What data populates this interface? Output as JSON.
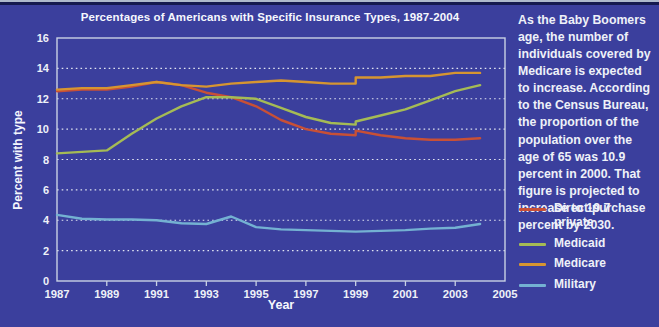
{
  "panel": {
    "background": "#3b3f9d",
    "title": "Percentages of Americans with Specific Insurance Types, 1987-2004"
  },
  "sidebar": {
    "text": "As the Baby Boomers age, the number of individuals covered by Medicare is expected to increase. According to the Census Bureau, the proportion of the population over the age of 65 was 10.9 percent in 2000. That figure is projected to increase to 19.7 percent by 2030."
  },
  "chart_data": {
    "type": "line",
    "title": "Percentages of Americans with Specific Insurance Types, 1987-2004",
    "xlabel": "Year",
    "ylabel": "Percent with type",
    "xlim": [
      1987,
      2005
    ],
    "ylim": [
      0,
      16
    ],
    "xticks": [
      1987,
      1989,
      1991,
      1993,
      1995,
      1997,
      1999,
      2001,
      2003,
      2005
    ],
    "yticks": [
      0,
      2,
      4,
      6,
      8,
      10,
      12,
      14,
      16
    ],
    "grid": "horizontal-dotted",
    "legend_position": "right",
    "note": "Duplicate x=1999 points encode the survey-redesign step visible in the plot",
    "series": [
      {
        "name": "Direct-purchase private",
        "color": "#c85036",
        "points": [
          [
            1987,
            12.5
          ],
          [
            1988,
            12.6
          ],
          [
            1989,
            12.6
          ],
          [
            1990,
            12.8
          ],
          [
            1991,
            13.1
          ],
          [
            1992,
            12.9
          ],
          [
            1993,
            12.4
          ],
          [
            1994,
            12.1
          ],
          [
            1995,
            11.5
          ],
          [
            1996,
            10.6
          ],
          [
            1997,
            10.0
          ],
          [
            1998,
            9.7
          ],
          [
            1999,
            9.6
          ],
          [
            1999,
            9.9
          ],
          [
            2000,
            9.6
          ],
          [
            2001,
            9.4
          ],
          [
            2002,
            9.3
          ],
          [
            2003,
            9.3
          ],
          [
            2004,
            9.4
          ]
        ]
      },
      {
        "name": "Medicaid",
        "color": "#a5bb55",
        "points": [
          [
            1987,
            8.4
          ],
          [
            1988,
            8.5
          ],
          [
            1989,
            8.6
          ],
          [
            1990,
            9.7
          ],
          [
            1991,
            10.7
          ],
          [
            1992,
            11.5
          ],
          [
            1993,
            12.1
          ],
          [
            1994,
            12.1
          ],
          [
            1995,
            12.0
          ],
          [
            1996,
            11.4
          ],
          [
            1997,
            10.8
          ],
          [
            1998,
            10.4
          ],
          [
            1999,
            10.3
          ],
          [
            1999,
            10.5
          ],
          [
            2000,
            10.9
          ],
          [
            2001,
            11.3
          ],
          [
            2002,
            11.9
          ],
          [
            2003,
            12.5
          ],
          [
            2004,
            12.9
          ]
        ]
      },
      {
        "name": "Medicare",
        "color": "#d69531",
        "points": [
          [
            1987,
            12.6
          ],
          [
            1988,
            12.7
          ],
          [
            1989,
            12.7
          ],
          [
            1990,
            12.9
          ],
          [
            1991,
            13.1
          ],
          [
            1992,
            12.9
          ],
          [
            1993,
            12.8
          ],
          [
            1994,
            13.0
          ],
          [
            1995,
            13.1
          ],
          [
            1996,
            13.2
          ],
          [
            1997,
            13.1
          ],
          [
            1998,
            13.0
          ],
          [
            1999,
            13.0
          ],
          [
            1999,
            13.4
          ],
          [
            2000,
            13.4
          ],
          [
            2001,
            13.5
          ],
          [
            2002,
            13.5
          ],
          [
            2003,
            13.7
          ],
          [
            2004,
            13.7
          ]
        ]
      },
      {
        "name": "Military",
        "color": "#74b1d2",
        "points": [
          [
            1987,
            4.35
          ],
          [
            1988,
            4.1
          ],
          [
            1989,
            4.05
          ],
          [
            1990,
            4.05
          ],
          [
            1991,
            4.0
          ],
          [
            1992,
            3.8
          ],
          [
            1993,
            3.75
          ],
          [
            1994,
            4.25
          ],
          [
            1995,
            3.55
          ],
          [
            1996,
            3.4
          ],
          [
            1997,
            3.35
          ],
          [
            1998,
            3.3
          ],
          [
            1999,
            3.25
          ],
          [
            2000,
            3.3
          ],
          [
            2001,
            3.35
          ],
          [
            2002,
            3.45
          ],
          [
            2003,
            3.5
          ],
          [
            2004,
            3.75
          ]
        ]
      }
    ]
  }
}
